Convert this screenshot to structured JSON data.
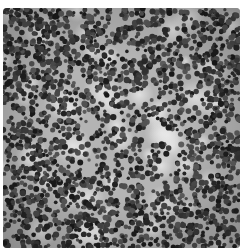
{
  "figure": {
    "caption_partial": "",
    "palette": {
      "nucleus_dark": "#2a2a2a",
      "nucleus_mid": "#555555",
      "background_light": "#d8d8d8",
      "background_mid": "#a0a0a0"
    }
  }
}
